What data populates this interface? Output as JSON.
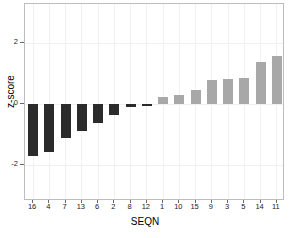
{
  "chart_data": {
    "type": "bar",
    "title": "",
    "xlabel": "SEQN",
    "ylabel": "z-score",
    "categories": [
      "16",
      "4",
      "7",
      "13",
      "6",
      "2",
      "8",
      "12",
      "1",
      "10",
      "15",
      "9",
      "3",
      "5",
      "14",
      "11"
    ],
    "values": [
      -1.72,
      -1.58,
      -1.13,
      -0.9,
      -0.62,
      -0.37,
      -0.1,
      -0.07,
      0.23,
      0.3,
      0.47,
      0.78,
      0.83,
      0.87,
      1.4,
      1.57
    ],
    "ylim": [
      -3.2,
      3.3
    ],
    "yticks": [
      2,
      0,
      -2
    ],
    "ytick_labels": [
      "2",
      "0",
      "-2"
    ],
    "grid": true,
    "legend": "none",
    "colors": {
      "negative_bar": "#2b2b2b",
      "positive_bar": "#a8a8a8",
      "frame": "#bdbdbd",
      "grid": "#f0f0f0",
      "background": "#ffffff",
      "text": "#000000"
    }
  }
}
